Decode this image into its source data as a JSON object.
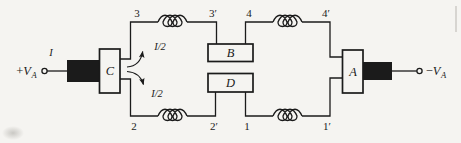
{
  "figure": {
    "ink_color": "#1b1b1b",
    "background_color": "#f5f4f1"
  },
  "terminals": {
    "left": {
      "sign": "+",
      "symbol": "V",
      "subscript": "A"
    },
    "right": {
      "sign": "−",
      "symbol": "V",
      "subscript": "A"
    }
  },
  "currents": {
    "input": "I",
    "upper_branch": "I/2",
    "lower_branch": "I/2"
  },
  "blocks": {
    "left": "C",
    "upper": "B",
    "lower": "D",
    "right": "A"
  },
  "nodes": {
    "top_left": "3",
    "top_left_prime": "3′",
    "top_right": "4",
    "top_right_prime": "4′",
    "bottom_left": "2",
    "bottom_left_prime": "2′",
    "bottom_right": "1",
    "bottom_right_prime": "1′"
  }
}
